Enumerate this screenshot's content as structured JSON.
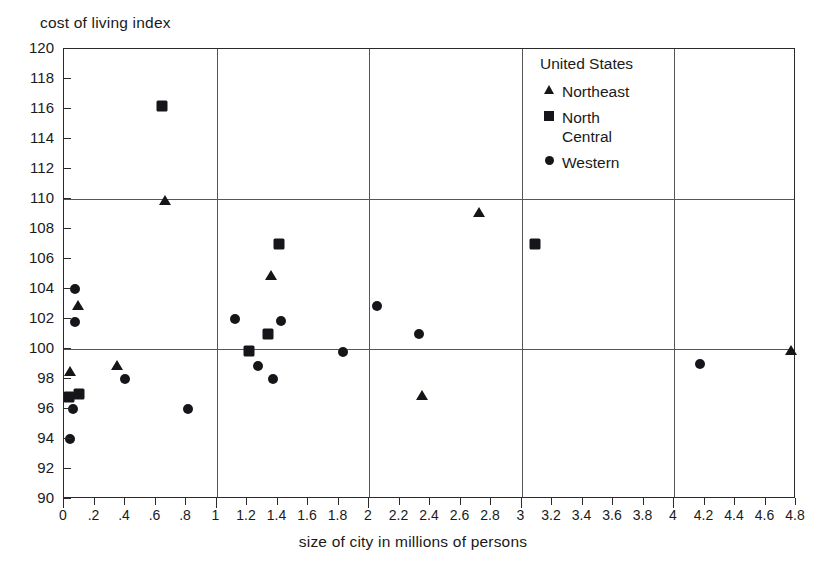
{
  "chart_data": {
    "type": "scatter",
    "title": "",
    "ylabel": "cost of living index",
    "xlabel": "size of city in millions of persons",
    "xlim": [
      0,
      4.8
    ],
    "ylim": [
      90,
      120
    ],
    "xticks": [
      "0",
      ".2",
      ".4",
      ".6",
      ".8",
      "1",
      "1.2",
      "1.4",
      "1.6",
      "1.8",
      "2",
      "2.2",
      "2.4",
      "2.6",
      "2.8",
      "3",
      "3.2",
      "3.4",
      "3.6",
      "3.8",
      "4",
      "4.2",
      "4.4",
      "4.6",
      "4.8"
    ],
    "xtick_values": [
      0,
      0.2,
      0.4,
      0.6,
      0.8,
      1,
      1.2,
      1.4,
      1.6,
      1.8,
      2,
      2.2,
      2.4,
      2.6,
      2.8,
      3,
      3.2,
      3.4,
      3.6,
      3.8,
      4,
      4.2,
      4.4,
      4.6,
      4.8
    ],
    "yticks": [
      "90",
      "92",
      "94",
      "96",
      "98",
      "100",
      "102",
      "104",
      "106",
      "108",
      "110",
      "112",
      "114",
      "116",
      "118",
      "120"
    ],
    "ytick_values": [
      90,
      92,
      94,
      96,
      98,
      100,
      102,
      104,
      106,
      108,
      110,
      112,
      114,
      116,
      118,
      120
    ],
    "gridlines_h": [
      100,
      110
    ],
    "gridlines_v": [
      1,
      2,
      3,
      4
    ],
    "grid": true,
    "legend_position": "top-right",
    "legend_title": "United States",
    "series": [
      {
        "name": "Northeast",
        "marker": "triangle",
        "color": "#16161a",
        "points": [
          {
            "x": 0.04,
            "y": 98.6
          },
          {
            "x": 0.09,
            "y": 103.0
          },
          {
            "x": 0.35,
            "y": 99.0
          },
          {
            "x": 0.66,
            "y": 110.0
          },
          {
            "x": 1.36,
            "y": 105.0
          },
          {
            "x": 2.35,
            "y": 97.0
          },
          {
            "x": 2.72,
            "y": 109.2
          },
          {
            "x": 4.77,
            "y": 100.0
          }
        ]
      },
      {
        "name": "North\nCentral",
        "marker": "square",
        "color": "#16161a",
        "points": [
          {
            "x": 0.03,
            "y": 96.8
          },
          {
            "x": 0.1,
            "y": 97.0
          },
          {
            "x": 0.64,
            "y": 116.2
          },
          {
            "x": 1.21,
            "y": 99.9
          },
          {
            "x": 1.34,
            "y": 101.0
          },
          {
            "x": 1.41,
            "y": 107.0
          },
          {
            "x": 3.09,
            "y": 107.0
          }
        ]
      },
      {
        "name": "Western",
        "marker": "circle",
        "color": "#16161a",
        "points": [
          {
            "x": 0.04,
            "y": 94.0
          },
          {
            "x": 0.06,
            "y": 96.0
          },
          {
            "x": 0.07,
            "y": 101.8
          },
          {
            "x": 0.07,
            "y": 104.0
          },
          {
            "x": 0.4,
            "y": 98.0
          },
          {
            "x": 0.81,
            "y": 96.0
          },
          {
            "x": 1.12,
            "y": 102.0
          },
          {
            "x": 1.27,
            "y": 98.9
          },
          {
            "x": 1.37,
            "y": 98.0
          },
          {
            "x": 1.42,
            "y": 101.9
          },
          {
            "x": 1.83,
            "y": 99.8
          },
          {
            "x": 2.05,
            "y": 102.9
          },
          {
            "x": 2.33,
            "y": 101.0
          },
          {
            "x": 4.17,
            "y": 99.0
          }
        ]
      }
    ]
  },
  "legend": {
    "title": "United States",
    "entries": [
      {
        "label": "Northeast",
        "marker": "triangle"
      },
      {
        "label": "North\nCentral",
        "marker": "square"
      },
      {
        "label": "Western",
        "marker": "circle"
      }
    ]
  },
  "axes": {
    "y_title": "cost of living index",
    "x_title": "size of city in millions of persons"
  }
}
